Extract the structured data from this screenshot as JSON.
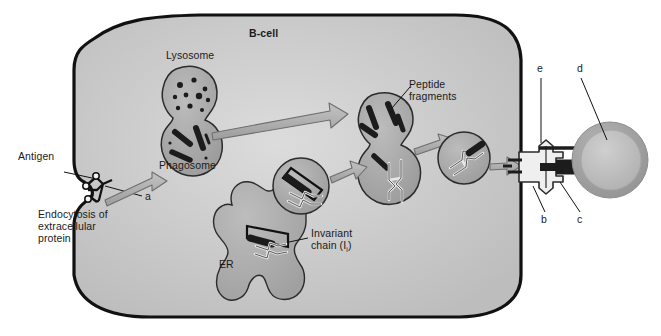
{
  "figure": {
    "title_label": "B-cell",
    "domain": "immunology-cell-diagram",
    "background_color": "#ffffff",
    "cell_fill_color": "#c9c9c9",
    "membrane_color": "#111111",
    "organelle_fill_color": "#a8a8a8",
    "arrow_fill_color": "#b4b4b4",
    "arrow_stroke_color": "#6e6e6e",
    "dark_particle_color": "#1c1c1c",
    "tcell_rim_color": "#9a9a9a",
    "tcell_inner_color": "#bdbdbd"
  },
  "labels": {
    "bcell": "B-cell",
    "lysosome": "Lysosome",
    "phagosome": "Phagosome",
    "antigen": "Antigen",
    "endocytosis_line1": "Endocytosis of",
    "endocytosis_line2": "extracellular",
    "endocytosis_line3": "protein",
    "peptide_line1": "Peptide",
    "peptide_line2": "fragments",
    "er": "ER",
    "invariant_line1": "Invariant",
    "invariant_line2_main": "chain (I",
    "invariant_line2_sub": "i",
    "invariant_line2_tail": ")"
  },
  "callouts": [
    {
      "id": "a",
      "letter": "a",
      "x": 145,
      "y": 195,
      "points_to": "b-cell-antigen-receptor"
    },
    {
      "id": "b",
      "letter": "b",
      "x": 543,
      "y": 219,
      "points_to": "mhc-class-ii-peptide-complex"
    },
    {
      "id": "c",
      "letter": "c",
      "x": 578,
      "y": 219,
      "points_to": "t-cell-receptor"
    },
    {
      "id": "d",
      "letter": "d",
      "x": 579,
      "y": 64,
      "points_to": "t-helper-cell"
    },
    {
      "id": "e",
      "letter": "e",
      "x": 539,
      "y": 64,
      "points_to": "mhc-class-ii-molecule"
    }
  ],
  "structures": [
    {
      "name": "b-cell-membrane",
      "description": "large rounded cell outline with endocytic invagination at left"
    },
    {
      "name": "antigen",
      "description": "branched surface antigen with three epitope beads"
    },
    {
      "name": "lysosome",
      "description": "upper vesicle containing small dark enzyme granules",
      "granule_count": 10
    },
    {
      "name": "phagosome",
      "description": "lower vesicle containing elongated dark protein fragments",
      "fragment_count": 4
    },
    {
      "name": "peptide-vesicle",
      "description": "fused vesicle with peptide fragments and MHC class II molecule"
    },
    {
      "name": "transport-vesicle",
      "description": "small vesicle carrying MHC class II loaded with peptide"
    },
    {
      "name": "endoplasmic-reticulum",
      "description": "lobed ER producing MHC class II with invariant chain"
    },
    {
      "name": "t-helper-cell",
      "description": "round cell contacting the B-cell surface"
    }
  ]
}
